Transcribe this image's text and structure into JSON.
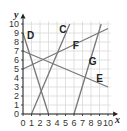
{
  "chart_data": {
    "type": "line",
    "title": "",
    "xlabel": "x",
    "ylabel": "y",
    "xlim": [
      0,
      10
    ],
    "ylim": [
      0,
      10
    ],
    "grid": true,
    "x_ticks": [
      "0",
      "1",
      "2",
      "3",
      "4",
      "5",
      "6",
      "7",
      "8",
      "9",
      "10"
    ],
    "y_ticks": [
      "0",
      "1",
      "2",
      "3",
      "4",
      "5",
      "6",
      "7",
      "8",
      "9",
      "10"
    ],
    "series": [
      {
        "name": "C",
        "points": [
          [
            1,
            0
          ],
          [
            5.5,
            10
          ]
        ]
      },
      {
        "name": "D",
        "points": [
          [
            0,
            9
          ],
          [
            3,
            0
          ]
        ]
      },
      {
        "name": "E",
        "points": [
          [
            0,
            7
          ],
          [
            10,
            3
          ]
        ]
      },
      {
        "name": "F",
        "points": [
          [
            0,
            5
          ],
          [
            10,
            9.5
          ]
        ]
      },
      {
        "name": "G",
        "points": [
          [
            6,
            0
          ],
          [
            9.2,
            10
          ]
        ]
      }
    ],
    "labels": [
      {
        "text": "C",
        "x": 4.7,
        "y": 9.0
      },
      {
        "text": "D",
        "x": 0.9,
        "y": 8.3
      },
      {
        "text": "E",
        "x": 9.0,
        "y": 3.6
      },
      {
        "text": "F",
        "x": 6.2,
        "y": 7.2
      },
      {
        "text": "G",
        "x": 8.2,
        "y": 5.4
      }
    ],
    "line_color": "#777777",
    "grid_color": "#d9d9d9"
  }
}
